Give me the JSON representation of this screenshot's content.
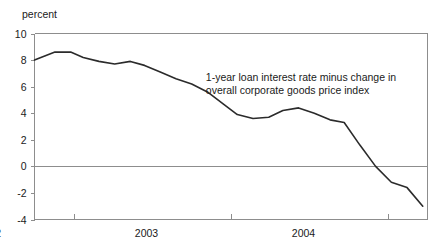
{
  "chart_data": {
    "type": "line",
    "title": "",
    "subtitle": "",
    "xlabel": "",
    "ylabel": "percent",
    "ylim": [
      -4,
      10
    ],
    "xlim": [
      2001.75,
      2004.25
    ],
    "grid": false,
    "legend_position": "none",
    "zero_line": 0,
    "y_ticks": [
      10,
      8,
      6,
      4,
      2,
      0,
      -2,
      -4
    ],
    "y_tick_labels": [
      "10",
      "8",
      "6",
      "4",
      "2",
      "0",
      "-2",
      "-4"
    ],
    "x_ticks": [
      2002.0,
      2003.0,
      2004.0
    ],
    "x_tick_labels": [
      "2002",
      "2003",
      "2004"
    ],
    "annotations": [
      {
        "text_line_1": "1-year loan interest rate minus change in",
        "text_line_2": "overall corporate goods price index",
        "x": 2002.84,
        "y": 6.45
      }
    ],
    "series": [
      {
        "name": "1-year loan interest rate minus change in overall corporate goods price index",
        "color": "#2b2b2b",
        "x": [
          2001.75,
          2001.88,
          2001.98,
          2002.06,
          2002.16,
          2002.26,
          2002.36,
          2002.45,
          2002.55,
          2002.65,
          2002.75,
          2002.85,
          2002.95,
          2003.04,
          2003.14,
          2003.24,
          2003.33,
          2003.43,
          2003.53,
          2003.63,
          2003.72,
          2003.82,
          2003.92,
          2004.02,
          2004.12,
          2004.22
        ],
        "y": [
          8.0,
          8.6,
          8.6,
          8.2,
          7.9,
          7.7,
          7.9,
          7.6,
          7.1,
          6.6,
          6.2,
          5.6,
          4.7,
          3.9,
          3.6,
          3.7,
          4.2,
          4.4,
          4.0,
          3.5,
          3.3,
          1.6,
          0.0,
          -1.2,
          -1.6,
          -3.0
        ]
      }
    ]
  },
  "axis": {
    "unit_label": "percent"
  }
}
